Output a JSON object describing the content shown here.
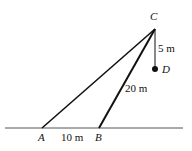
{
  "diagram": {
    "points": {
      "A": {
        "label": "A",
        "x": 42,
        "y": 128
      },
      "B": {
        "label": "B",
        "x": 99,
        "y": 128
      },
      "C": {
        "label": "C",
        "x": 155,
        "y": 29
      },
      "D": {
        "label": "D",
        "x": 155,
        "y": 69
      }
    },
    "segments": [
      {
        "from": "A",
        "to": "C"
      },
      {
        "from": "B",
        "to": "C",
        "label": "20 m"
      },
      {
        "from": "C",
        "to": "D",
        "label": "5 m"
      }
    ],
    "ground": {
      "x1": 5,
      "x2": 183,
      "y": 128
    },
    "measurements": {
      "AB": "10 m",
      "BC": "20 m",
      "CD": "5 m"
    },
    "colors": {
      "line": "#111111",
      "background": "#ffffff"
    }
  }
}
